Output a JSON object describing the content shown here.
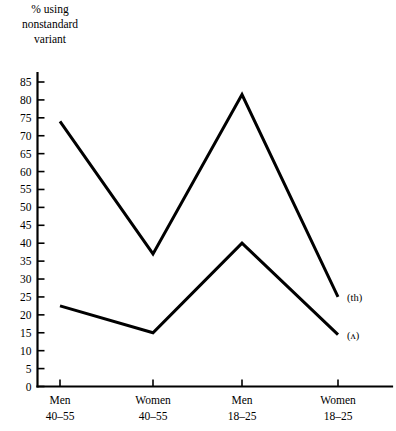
{
  "axis_title": "% using\nnonstandard\nvariant",
  "chart_data": {
    "type": "line",
    "title": "",
    "subtitle": "",
    "xlabel": "",
    "ylabel": "% using nonstandard variant",
    "categories": [
      "Men\n40–55",
      "Women\n40–55",
      "Men\n18–25",
      "Women\n18–25"
    ],
    "category_lines": [
      [
        "Men",
        "40–55"
      ],
      [
        "Women",
        "40–55"
      ],
      [
        "Men",
        "18–25"
      ],
      [
        "Women",
        "18–25"
      ]
    ],
    "series": [
      {
        "name": "(th)",
        "values": [
          74,
          37,
          81.5,
          25
        ]
      },
      {
        "name": "(ʌ)",
        "values": [
          22.5,
          15,
          40,
          14.5
        ]
      }
    ],
    "ylim": [
      0,
      87
    ],
    "yticks": [
      0,
      5,
      10,
      15,
      20,
      25,
      30,
      35,
      40,
      45,
      50,
      55,
      60,
      65,
      70,
      75,
      80,
      85
    ],
    "ytick_labels": [
      "0",
      "5",
      "10",
      "15",
      "20",
      "25",
      "30",
      "35",
      "40",
      "45",
      "50",
      "55",
      "60",
      "65",
      "70",
      "75",
      "80",
      "85"
    ],
    "grid": false,
    "legend_position": "right-inline",
    "line_color": "#000000",
    "background_color": "#ffffff"
  }
}
